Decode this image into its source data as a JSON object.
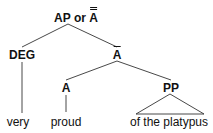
{
  "diagram": {
    "type": "syntax-tree",
    "root": {
      "prefix": "AP or ",
      "label_char": "A",
      "bar_level": 2
    },
    "nodes": {
      "deg": {
        "label": "DEG"
      },
      "a_bar": {
        "label_char": "A",
        "bar_level": 1
      },
      "a": {
        "label": "A"
      },
      "pp": {
        "label": "PP"
      }
    },
    "leaves": {
      "very": "very",
      "proud": "proud",
      "pp_text": "of the platypus"
    },
    "edges": [
      {
        "from": "AP or A-double-bar",
        "to": "DEG"
      },
      {
        "from": "AP or A-double-bar",
        "to": "A-bar"
      },
      {
        "from": "A-bar",
        "to": "A"
      },
      {
        "from": "A-bar",
        "to": "PP"
      },
      {
        "from": "DEG",
        "to": "very"
      },
      {
        "from": "A",
        "to": "proud"
      },
      {
        "from": "PP",
        "to": "of the platypus",
        "style": "triangle"
      }
    ],
    "colors": {
      "line": "#333333",
      "text": "#111111",
      "background": "#ffffff"
    }
  }
}
